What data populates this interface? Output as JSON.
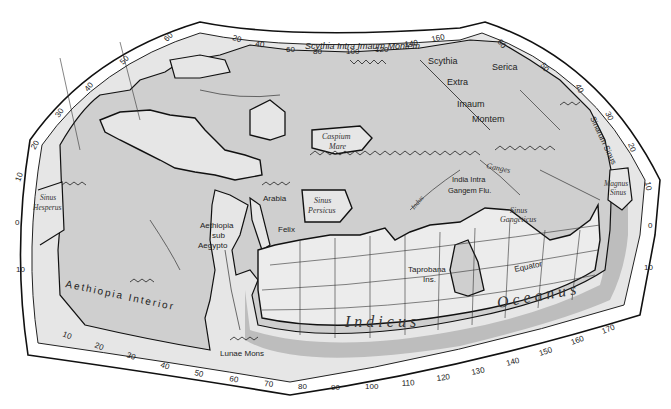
{
  "map": {
    "title": "Ptolemy's World Map",
    "colors": {
      "background": "#ffffff",
      "frame_band": "#ffffff",
      "graticule_fill": "#e8e8e8",
      "land": "#cfcfcf",
      "sea": "#ececec",
      "outline": "#1a1a1a",
      "ocean_rim": "#bdbdbd"
    },
    "regions": {
      "scythia_intra": "Scythia Intra Imaum Montem",
      "scythia": "Scythia",
      "extra": "Extra",
      "imaum": "Imaum",
      "montem": "Montem",
      "serica": "Serica",
      "sinarum_sinus": "Sinarum Sinus",
      "caspium_1": "Caspium",
      "caspium_2": "Mare",
      "ganges": "Ganges",
      "india_1": "India Intra",
      "india_2": "Gangem Flu.",
      "indus": "Indus",
      "magnus_1": "Magnus",
      "magnus_2": "Sinus",
      "arabia": "Arabia",
      "felix": "Felix",
      "persicus_1": "Sinus",
      "persicus_2": "Persicus",
      "hesperus_1": "Sinus",
      "hesperus_2": "Hesperus",
      "aethiopia_sub_1": "Aethiopia",
      "aethiopia_sub_2": "sub",
      "aethiopia_sub_3": "Aegypto",
      "gangeticus_1": "Sinus",
      "gangeticus_2": "Gangeticus",
      "taprobana_1": "Taprobana",
      "taprobana_2": "Ins.",
      "equator": "Equator",
      "aethiopia_interior": "Aethiopia   Interior",
      "lunae_mons": "Lunae Mons",
      "indicus": "I n d i c u s",
      "oceanus": "O c e a n u s"
    },
    "top_longitudes": [
      "20",
      "40",
      "60",
      "80",
      "100",
      "120",
      "140",
      "160"
    ],
    "bottom_longitudes": [
      "10",
      "20",
      "30",
      "40",
      "50",
      "60",
      "70",
      "80",
      "90",
      "100",
      "110",
      "120",
      "130",
      "140",
      "150",
      "160",
      "170"
    ],
    "left_latitudes": [
      "60",
      "50",
      "40",
      "30",
      "20",
      "10",
      "0",
      "10"
    ],
    "right_latitudes": [
      "60",
      "50",
      "40",
      "30",
      "20",
      "10",
      "0",
      "10"
    ]
  }
}
